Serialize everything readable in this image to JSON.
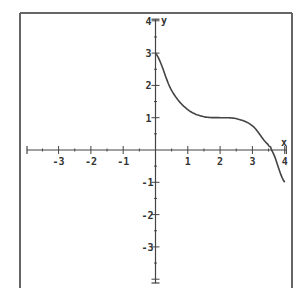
{
  "chart_data": {
    "type": "line",
    "title": "",
    "xlabel": "x",
    "ylabel": "y",
    "xlim": [
      -4.1,
      4.1
    ],
    "ylim": [
      -4.1,
      4.1
    ],
    "grid": false,
    "legend": null,
    "x_ticks": [
      -3,
      -2,
      -1,
      1,
      2,
      3,
      4
    ],
    "y_ticks": [
      4,
      3,
      2,
      1,
      -1,
      -2,
      -3
    ],
    "minor_tick_step": 0.5,
    "series": [
      {
        "name": "f(x)",
        "x": [
          0,
          0.5,
          1,
          1.5,
          2,
          2.5,
          3,
          3.5,
          3.59,
          4
        ],
        "y": [
          3,
          1.84,
          1.25,
          1.03,
          1,
          0.97,
          0.75,
          0.16,
          0,
          -1
        ]
      }
    ],
    "annotations": [
      "curve starts at (0,3)",
      "flat inflection near (2,1)",
      "crosses x-axis near x≈3.6",
      "ends at (4,-1)"
    ]
  },
  "axes": {
    "x_label": "x",
    "y_label": "y"
  },
  "colors": {
    "frame": "#555555",
    "axis": "#444444",
    "curve": "#444444",
    "background": "#ffffff"
  }
}
